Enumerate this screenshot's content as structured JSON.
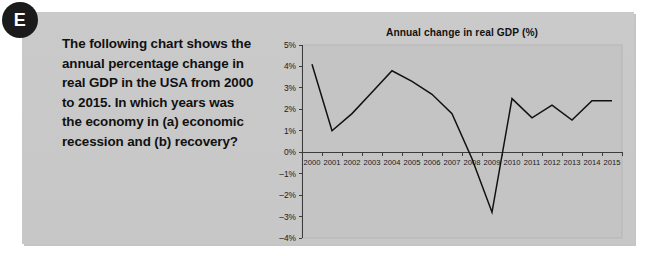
{
  "badge": {
    "label": "E"
  },
  "question": {
    "text": "The following chart shows the annual percentage change in real GDP in the USA from 2000 to 2015. In which years was the economy in (a) economic recession and (b) recovery?"
  },
  "colors": {
    "panel_background": "#c9c9c9",
    "plot_background": "#c4c4c4",
    "line": "#111111",
    "axis": "#3c3c3c",
    "text": "#111111",
    "badge_background": "#1b1b1b",
    "badge_text": "#ffffff"
  },
  "chart_data": {
    "type": "line",
    "title": "Annual change in real GDP (%)",
    "xlabel": "",
    "ylabel": "",
    "categories": [
      "2000",
      "2001",
      "2002",
      "2003",
      "2004",
      "2005",
      "2006",
      "2007",
      "2008",
      "2009",
      "2010",
      "2011",
      "2012",
      "2013",
      "2014",
      "2015"
    ],
    "values": [
      4.1,
      1.0,
      1.8,
      2.8,
      3.8,
      3.3,
      2.7,
      1.8,
      -0.3,
      -2.8,
      2.5,
      1.6,
      2.2,
      1.5,
      2.4,
      2.4
    ],
    "series": [
      {
        "name": "Annual change in real GDP (%)",
        "values": [
          4.1,
          1.0,
          1.8,
          2.8,
          3.8,
          3.3,
          2.7,
          1.8,
          -0.3,
          -2.8,
          2.5,
          1.6,
          2.2,
          1.5,
          2.4,
          2.4
        ]
      }
    ],
    "ylim": [
      -4,
      5
    ],
    "ytick_values": [
      5,
      4,
      3,
      2,
      1,
      0,
      -1,
      -2,
      -3,
      -4
    ],
    "ytick_labels": [
      "5%",
      "4%",
      "3%",
      "2%",
      "1%",
      "0%",
      "–1%",
      "–2%",
      "–3%",
      "–4%"
    ],
    "grid": false,
    "legend": "none"
  }
}
